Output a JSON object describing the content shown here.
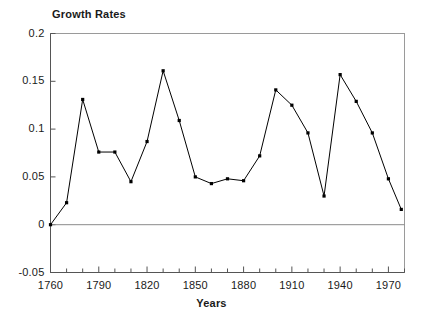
{
  "chart_data": {
    "type": "line",
    "title": "Growth Rates",
    "xlabel": "Years",
    "ylabel": "",
    "xlim": [
      1760,
      1980
    ],
    "ylim": [
      -0.05,
      0.2
    ],
    "grid": false,
    "legend": "none",
    "marker": "square",
    "line_color": "#000000",
    "xticks": [
      1760,
      1790,
      1820,
      1850,
      1880,
      1910,
      1940,
      1970
    ],
    "xtick_labels": [
      "1760",
      "1790",
      "1820",
      "1850",
      "1880",
      "1910",
      "1940",
      "1970"
    ],
    "xminor_step": 10,
    "yticks": [
      -0.05,
      0,
      0.05,
      0.1,
      0.15,
      0.2
    ],
    "ytick_labels": [
      "-0.05",
      "0",
      "0.05",
      "0.1",
      "0.15",
      "0.2"
    ],
    "x": [
      1760,
      1770,
      1780,
      1790,
      1800,
      1810,
      1820,
      1830,
      1840,
      1850,
      1860,
      1870,
      1880,
      1890,
      1900,
      1910,
      1920,
      1930,
      1940,
      1950,
      1960,
      1970,
      1978
    ],
    "values": [
      0.0,
      0.023,
      0.131,
      0.076,
      0.076,
      0.045,
      0.087,
      0.161,
      0.109,
      0.05,
      0.043,
      0.048,
      0.046,
      0.072,
      0.141,
      0.125,
      0.096,
      0.03,
      0.157,
      0.129,
      0.096,
      0.048,
      0.016
    ],
    "series": [
      {
        "name": "Growth Rates",
        "points": [
          {
            "x": 1760,
            "y": 0.0
          },
          {
            "x": 1770,
            "y": 0.023
          },
          {
            "x": 1780,
            "y": 0.131
          },
          {
            "x": 1790,
            "y": 0.076
          },
          {
            "x": 1800,
            "y": 0.076
          },
          {
            "x": 1810,
            "y": 0.045
          },
          {
            "x": 1820,
            "y": 0.087
          },
          {
            "x": 1830,
            "y": 0.161
          },
          {
            "x": 1840,
            "y": 0.109
          },
          {
            "x": 1850,
            "y": 0.05
          },
          {
            "x": 1860,
            "y": 0.043
          },
          {
            "x": 1870,
            "y": 0.048
          },
          {
            "x": 1880,
            "y": 0.046
          },
          {
            "x": 1890,
            "y": 0.072
          },
          {
            "x": 1900,
            "y": 0.141
          },
          {
            "x": 1910,
            "y": 0.125
          },
          {
            "x": 1920,
            "y": 0.096
          },
          {
            "x": 1930,
            "y": 0.03
          },
          {
            "x": 1940,
            "y": 0.157
          },
          {
            "x": 1950,
            "y": 0.129
          },
          {
            "x": 1960,
            "y": 0.096
          },
          {
            "x": 1970,
            "y": 0.048
          },
          {
            "x": 1978,
            "y": 0.016
          }
        ]
      }
    ]
  }
}
